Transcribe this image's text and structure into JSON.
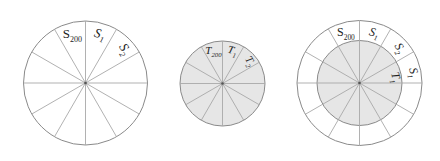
{
  "colors": {
    "background": "#ffffff",
    "outline": "#8a8a8a",
    "spoke": "#a8a8a8",
    "fill": "#e6e6e6",
    "text": "#222222"
  },
  "diagrams": [
    {
      "id": "circle-s",
      "cx": 85.5,
      "cy": 83,
      "outer_r": 62,
      "inner_r": 0,
      "sectors": 12,
      "filled": false,
      "labels": [
        {
          "base": "S",
          "sub": "200",
          "italic": false
        },
        {
          "base": "S",
          "sub": "1",
          "italic": true
        },
        {
          "base": "S",
          "sub": "2",
          "italic": true
        }
      ]
    },
    {
      "id": "circle-t",
      "cx": 222.5,
      "cy": 83.5,
      "outer_r": 42.5,
      "inner_r": 0,
      "sectors": 12,
      "filled": true,
      "labels": [
        {
          "base": "T",
          "sub": "200",
          "italic": true
        },
        {
          "base": "T",
          "sub": "1",
          "italic": true
        },
        {
          "base": "T",
          "sub": "2",
          "italic": true
        }
      ]
    },
    {
      "id": "circle-combined",
      "cx": 359.5,
      "cy": 83,
      "outer_r": 62.5,
      "inner_r": 42.5,
      "sectors": 12,
      "filled": true,
      "outer_labels": [
        {
          "base": "S",
          "sub": "200",
          "italic": false
        },
        {
          "base": "S",
          "sub": "1",
          "italic": true
        },
        {
          "base": "S",
          "sub": "2",
          "italic": true
        },
        {
          "base": "S",
          "sub": "1",
          "italic": true
        }
      ],
      "inner_labels": [
        {
          "base": "T",
          "sub": "1",
          "italic": true
        }
      ]
    }
  ]
}
